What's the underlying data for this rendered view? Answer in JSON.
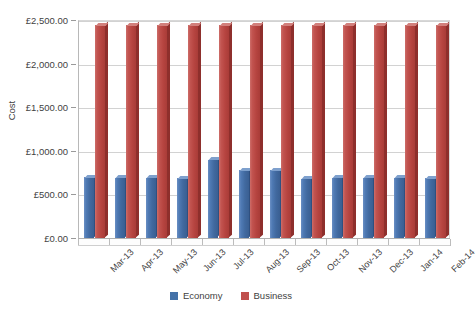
{
  "chart_data": {
    "type": "bar",
    "title": "",
    "xlabel": "",
    "ylabel": "Cost",
    "ylim": [
      0,
      2500
    ],
    "ytick_values": [
      0,
      500,
      1000,
      1500,
      2000,
      2500
    ],
    "ytick_labels": [
      "£0.00",
      "£500.00",
      "£1,000.00",
      "£1,500.00",
      "£2,000.00",
      "£2,500.00"
    ],
    "grid": true,
    "legend_position": "bottom",
    "categories": [
      "Mar-13",
      "Apr-13",
      "May-13",
      "Jun-13",
      "Jul-13",
      "Aug-13",
      "Sep-13",
      "Oct-13",
      "Nov-13",
      "Dec-13",
      "Jan-14",
      "Feb-14"
    ],
    "series": [
      {
        "name": "Economy",
        "color": "#4472A8",
        "values": [
          700,
          690,
          690,
          685,
          900,
          775,
          780,
          680,
          690,
          690,
          690,
          685
        ]
      },
      {
        "name": "Business",
        "color": "#C0504D",
        "values": [
          2440,
          2440,
          2440,
          2440,
          2440,
          2440,
          2440,
          2440,
          2440,
          2440,
          2440,
          2440
        ]
      }
    ]
  },
  "axis": {
    "y_title": "Cost"
  },
  "legend": {
    "items": [
      {
        "label": "Economy",
        "color": "#4472A8",
        "swatch_name": "legend-swatch-economy"
      },
      {
        "label": "Business",
        "color": "#C0504D",
        "swatch_name": "legend-swatch-business"
      }
    ]
  }
}
